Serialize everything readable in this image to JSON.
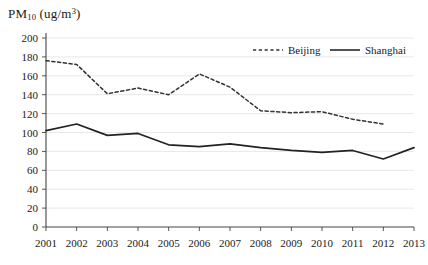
{
  "chart_data": {
    "type": "line",
    "title": "PM10 (ug/m3)",
    "title_parts": {
      "base": "PM",
      "sub": "10",
      "unit_open": " (ug/m",
      "sup": "3",
      "unit_close": ")"
    },
    "xlabel": "",
    "ylabel": "PM10 (ug/m3)",
    "x": [
      2001,
      2002,
      2003,
      2004,
      2005,
      2006,
      2007,
      2008,
      2009,
      2010,
      2011,
      2012,
      2013
    ],
    "xticklabels": [
      "2001",
      "2002",
      "2003",
      "2004",
      "2005",
      "2006",
      "2007",
      "2008",
      "2009",
      "2010",
      "2011",
      "2012",
      "2013"
    ],
    "yticks": [
      0,
      20,
      40,
      60,
      80,
      100,
      120,
      140,
      160,
      180,
      200
    ],
    "yticklabels": [
      "0",
      "20",
      "40",
      "60",
      "80",
      "100",
      "120",
      "140",
      "160",
      "180",
      "200"
    ],
    "ylim": [
      0,
      200
    ],
    "xlim": [
      2001,
      2013
    ],
    "grid": true,
    "grid_axis": "y",
    "legend_position": "top-right",
    "series": [
      {
        "name": "Beijing",
        "style": "dashed",
        "color": "#333333",
        "x": [
          2001,
          2002,
          2003,
          2004,
          2005,
          2006,
          2007,
          2008,
          2009,
          2010,
          2011,
          2012
        ],
        "values": [
          176,
          172,
          141,
          147,
          140,
          162,
          148,
          123,
          121,
          122,
          114,
          109
        ]
      },
      {
        "name": "Shanghai",
        "style": "solid",
        "color": "#222222",
        "x": [
          2001,
          2002,
          2003,
          2004,
          2005,
          2006,
          2007,
          2008,
          2009,
          2010,
          2011,
          2012,
          2013
        ],
        "values": [
          102,
          109,
          97,
          99,
          87,
          85,
          88,
          84,
          81,
          79,
          81,
          72,
          84
        ]
      }
    ]
  },
  "legend": {
    "items": [
      {
        "label": "Beijing",
        "style": "dashed"
      },
      {
        "label": "Shanghai",
        "style": "solid"
      }
    ]
  }
}
